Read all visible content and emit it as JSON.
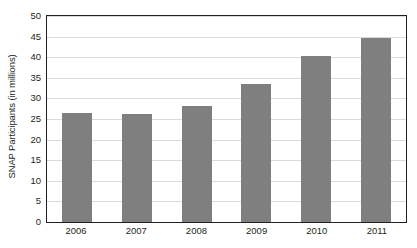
{
  "chart_data": {
    "type": "bar",
    "title": "",
    "subtitle": "",
    "xlabel": "",
    "ylabel": "SNAP Participants (in millions)",
    "categories": [
      "2006",
      "2007",
      "2008",
      "2009",
      "2010",
      "2011"
    ],
    "values": [
      26.5,
      26.3,
      28.2,
      33.5,
      40.3,
      44.7
    ],
    "series": [
      {
        "name": "SNAP Participants",
        "values": [
          26.5,
          26.3,
          28.2,
          33.5,
          40.3,
          44.7
        ]
      }
    ],
    "ylim": [
      0,
      50
    ],
    "ytick_labels": [
      "50",
      "45",
      "40",
      "35",
      "30",
      "25",
      "20",
      "15",
      "10",
      "5",
      "0"
    ],
    "ytick_values": [
      50,
      45,
      40,
      35,
      30,
      25,
      20,
      15,
      10,
      5,
      0
    ],
    "grid": true,
    "grid_axis": "y",
    "legend": false,
    "legend_position": "none",
    "bar_color": "#7f7f7f",
    "gridline_color": "#d9dada",
    "axis_color": "#231f20",
    "text_color": "#231f20",
    "background_color": "#ffffff",
    "annotations": []
  },
  "axes": {
    "y_title": "SNAP Participants (in millions)"
  },
  "clipped_header": {
    "text": ""
  }
}
